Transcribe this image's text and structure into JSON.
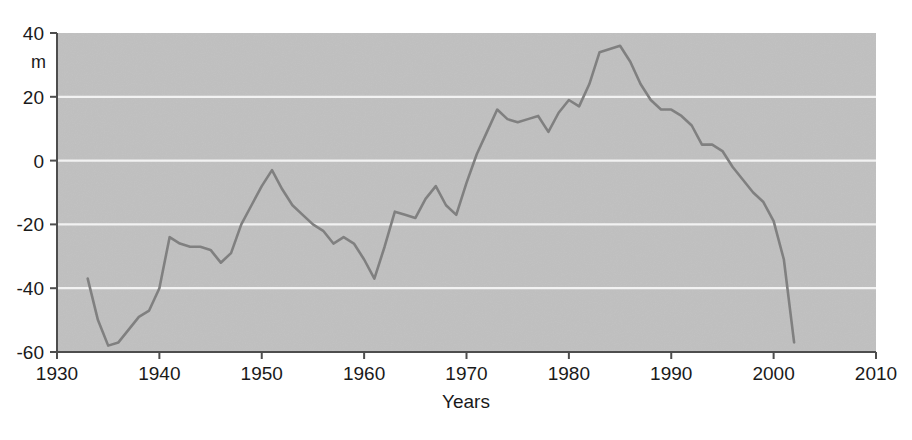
{
  "chart_data": {
    "type": "line",
    "title": "",
    "xlabel": "Years",
    "ylabel": "m",
    "xlim": [
      1930,
      2010
    ],
    "ylim": [
      -60,
      40
    ],
    "xticks": [
      1930,
      1940,
      1950,
      1960,
      1970,
      1980,
      1990,
      2000,
      2010
    ],
    "yticks": [
      40,
      20,
      0,
      -20,
      -40,
      -60
    ],
    "xtick_labels": [
      "1930",
      "1940",
      "1950",
      "1960",
      "1970",
      "1980",
      "1990",
      "2000",
      "2010"
    ],
    "ytick_labels": [
      "40",
      "20",
      "0",
      "-20",
      "-40",
      "-60"
    ],
    "grid": "horizontal",
    "grid_color": "#f2f2f2",
    "plot_bg": "#d4d4d4",
    "line_color": "#808080",
    "axis_color": "#4d4d4d",
    "legend": null,
    "series": [
      {
        "name": "cumulative mass balance",
        "x": [
          1933,
          1934,
          1935,
          1936,
          1937,
          1938,
          1939,
          1940,
          1941,
          1942,
          1943,
          1944,
          1945,
          1946,
          1947,
          1948,
          1949,
          1950,
          1951,
          1952,
          1953,
          1954,
          1955,
          1956,
          1957,
          1958,
          1959,
          1960,
          1961,
          1962,
          1963,
          1964,
          1965,
          1966,
          1967,
          1968,
          1969,
          1970,
          1971,
          1972,
          1973,
          1974,
          1975,
          1976,
          1977,
          1978,
          1979,
          1980,
          1981,
          1982,
          1983,
          1984,
          1985,
          1986,
          1987,
          1988,
          1989,
          1990,
          1991,
          1992,
          1993,
          1994,
          1995,
          1996,
          1997,
          1998,
          1999,
          2000,
          2001,
          2002
        ],
        "y": [
          -37,
          -50,
          -58,
          -57,
          -53,
          -49,
          -47,
          -40,
          -24,
          -26,
          -27,
          -27,
          -28,
          -32,
          -29,
          -20,
          -14,
          -8,
          -3,
          -9,
          -14,
          -17,
          -20,
          -22,
          -26,
          -24,
          -26,
          -31,
          -37,
          -27,
          -16,
          -17,
          -18,
          -12,
          -8,
          -14,
          -17,
          -7,
          2,
          9,
          16,
          13,
          12,
          13,
          14,
          9,
          15,
          19,
          17,
          24,
          34,
          35,
          36,
          31,
          24,
          19,
          16,
          16,
          14,
          11,
          5,
          5,
          3,
          -2,
          -6,
          -10,
          -13,
          -19,
          -31,
          -57
        ]
      }
    ]
  },
  "axes": {
    "y_unit_label": "m",
    "x_axis_title": "Years"
  }
}
